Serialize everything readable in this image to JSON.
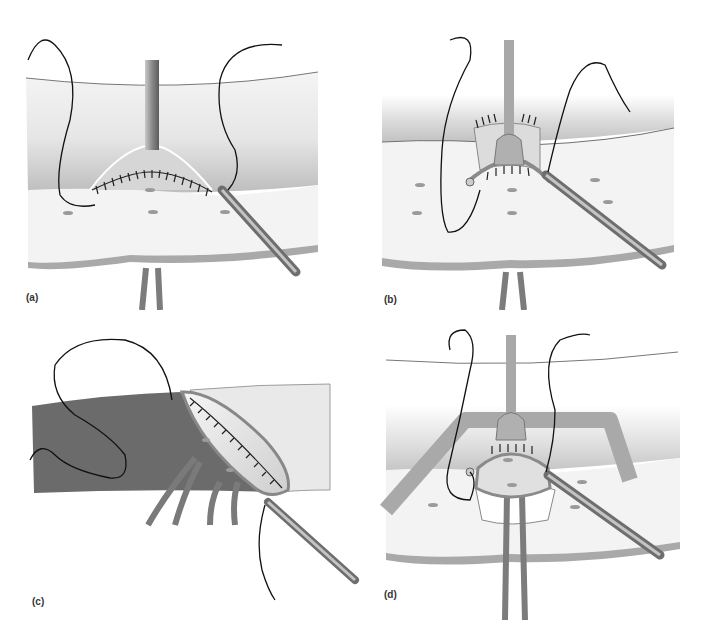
{
  "figure": {
    "panels": [
      {
        "id": "a",
        "label": "(a)"
      },
      {
        "id": "b",
        "label": "(b)"
      },
      {
        "id": "c",
        "label": "(c)"
      },
      {
        "id": "d",
        "label": "(d)"
      }
    ]
  },
  "colors": {
    "tissue_light": "#f2f2f2",
    "tissue_shade": "#b9b9b9",
    "tissue_dark": "#6b6b6b",
    "instrument": "#9a9a9a",
    "suture": "#111111",
    "vessel": "#7a7a7a",
    "band": "#a8a8a8"
  }
}
